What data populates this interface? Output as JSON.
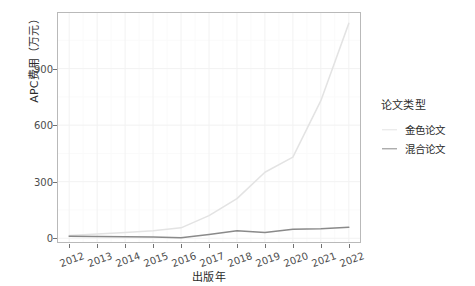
{
  "chart_data": {
    "type": "line",
    "title": "",
    "xlabel": "出版年",
    "ylabel": "APC费用（万元）",
    "x": [
      2012,
      2013,
      2014,
      2015,
      2016,
      2017,
      2018,
      2019,
      2020,
      2021,
      2022
    ],
    "xtick_labels": [
      "2012",
      "2013",
      "2014",
      "2015",
      "2016",
      "2017",
      "2018",
      "2019",
      "2020",
      "2021",
      "2022"
    ],
    "ytick_labels": [
      "0",
      "300",
      "600",
      "900"
    ],
    "yticks": [
      0,
      300,
      600,
      900
    ],
    "ylim": [
      -20,
      1195
    ],
    "xlim": [
      2011.6,
      2022.4
    ],
    "grid": true,
    "legend_position": "right",
    "legend_title": "论文类型",
    "series": [
      {
        "name": "金色论文",
        "color": "#e3e3e3",
        "values": [
          15,
          22,
          30,
          40,
          55,
          120,
          210,
          350,
          430,
          730,
          1140
        ]
      },
      {
        "name": "混合论文",
        "color": "#8a8a8a",
        "values": [
          10,
          9,
          8,
          6,
          2,
          20,
          40,
          30,
          48,
          50,
          58
        ]
      }
    ]
  },
  "axes": {
    "y_title": "APC费用（万元）",
    "x_title": "出版年"
  },
  "legend": {
    "title": "论文类型",
    "items": [
      {
        "label": "金色论文",
        "color": "#e3e3e3"
      },
      {
        "label": "混合论文",
        "color": "#8a8a8a"
      }
    ]
  },
  "colors": {
    "panel_background": "#ffffff",
    "panel_border": "#b9b9b9",
    "grid_major": "#f2f2f2",
    "grid_minor": "#fafafa",
    "tick_text": "#4d4d4d",
    "title_text": "#2b2b2b"
  }
}
